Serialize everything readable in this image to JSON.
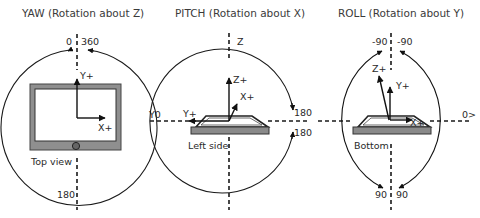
{
  "diagrams": [
    {
      "id": "yaw",
      "title": "YAW (Rotation about Z)",
      "top_labels": [
        "0",
        "360"
      ],
      "bottom_label": "180",
      "right_label": "",
      "left_label": "",
      "device_view": "Top view",
      "axes": [
        "Y+",
        "X+"
      ]
    },
    {
      "id": "pitch",
      "title": "PITCH (Rotation about X)",
      "top_label": "Z",
      "left_label": "Y0",
      "right_labels": [
        "180",
        "180"
      ],
      "device_view": "Left side",
      "axes": [
        "Z+",
        "X+",
        "Y+"
      ]
    },
    {
      "id": "roll",
      "title": "ROLL (Rotation about Y)",
      "top_labels": [
        "-90",
        "-90"
      ],
      "bottom_labels": [
        "90",
        "90"
      ],
      "right_label": "0>",
      "device_view": "Bottom",
      "axes": [
        "Z+",
        "Y+",
        "X+"
      ]
    }
  ],
  "colors": {
    "line": "#111111",
    "device_frame": "#8c8c8c",
    "device_screen": "#ffffff",
    "device_bezel": "#555555"
  }
}
